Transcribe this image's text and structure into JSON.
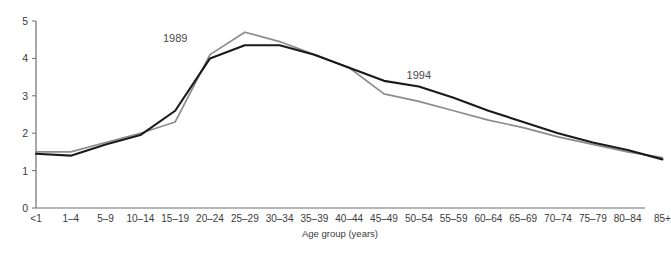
{
  "chart_data": {
    "type": "line",
    "title": "",
    "xlabel": "Age group (years)",
    "ylabel": "",
    "ylim": [
      0,
      5
    ],
    "yticks": [
      0,
      1,
      2,
      3,
      4,
      5
    ],
    "ytick_labels": [
      "0",
      "1",
      "2",
      "3",
      "4",
      "5"
    ],
    "grid": false,
    "legend_position": "inline-annotation",
    "categories": [
      "<1",
      "1–4",
      "5–9",
      "10–14",
      "15–19",
      "20–24",
      "25–29",
      "30–34",
      "35–39",
      "40–44",
      "45–49",
      "50–54",
      "55–59",
      "60–64",
      "65–69",
      "70–74",
      "75–79",
      "80–84",
      "85+"
    ],
    "series": [
      {
        "name": "1989",
        "color": "#8c8c8c",
        "values": [
          1.5,
          1.5,
          1.75,
          2.0,
          2.3,
          4.1,
          4.7,
          4.45,
          4.1,
          3.75,
          3.05,
          2.85,
          2.6,
          2.35,
          2.15,
          1.9,
          1.7,
          1.5,
          1.35
        ]
      },
      {
        "name": "1994",
        "color": "#1a1a1a",
        "values": [
          1.45,
          1.4,
          1.7,
          1.95,
          2.6,
          4.0,
          4.35,
          4.35,
          4.1,
          3.75,
          3.4,
          3.25,
          2.95,
          2.6,
          2.3,
          2.0,
          1.75,
          1.55,
          1.3
        ]
      }
    ],
    "annotations": [
      {
        "text": "1989",
        "category_index": 4,
        "value": 4.55
      },
      {
        "text": "1994",
        "category_index": 11,
        "value": 3.55
      }
    ]
  }
}
